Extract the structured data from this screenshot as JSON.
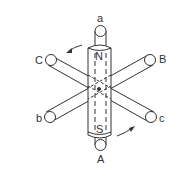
{
  "diagram": {
    "type": "rotating-magnet-three-phase-coils",
    "labels": {
      "top": "a",
      "bottom": "A",
      "upper_left": "C",
      "upper_right": "B",
      "lower_left": "b",
      "lower_right": "c"
    },
    "magnet": {
      "north": "N",
      "south": "S"
    },
    "rotation": "counterclockwise",
    "colors": {
      "stroke": "#333333",
      "background": "#ffffff"
    }
  }
}
